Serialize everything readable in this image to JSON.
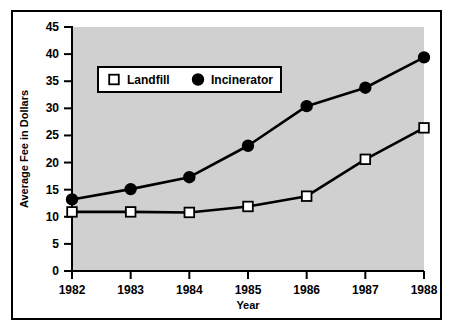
{
  "chart_data": {
    "type": "line",
    "title": "",
    "xlabel": "Year",
    "ylabel": "Average Fee in Dollars",
    "categories": [
      "1982",
      "1983",
      "1984",
      "1985",
      "1986",
      "1987",
      "1988"
    ],
    "x": [
      1982,
      1983,
      1984,
      1985,
      1986,
      1987,
      1988
    ],
    "series": [
      {
        "name": "Landfill",
        "marker": "open-square",
        "marker_fill": "#ffffff",
        "line_color": "#000000",
        "values": [
          10.9,
          10.9,
          10.8,
          11.9,
          13.8,
          20.6,
          26.4
        ]
      },
      {
        "name": "Incinerator",
        "marker": "filled-circle",
        "marker_fill": "#000000",
        "line_color": "#000000",
        "values": [
          13.2,
          15.1,
          17.3,
          23.1,
          30.4,
          33.8,
          39.4
        ]
      }
    ],
    "xlim": [
      1982,
      1988
    ],
    "ylim": [
      0,
      45
    ],
    "yticks": [
      0,
      5,
      10,
      15,
      20,
      25,
      30,
      35,
      40,
      45
    ],
    "ytick_labels": [
      "0",
      "5",
      "10",
      "15",
      "20",
      "25",
      "30",
      "35",
      "40",
      "45"
    ],
    "xticks": [
      1982,
      1983,
      1984,
      1985,
      1986,
      1987,
      1988
    ],
    "xtick_labels": [
      "1982",
      "1983",
      "1984",
      "1985",
      "1986",
      "1987",
      "1988"
    ],
    "grid": false,
    "legend_position": "upper-left-inside",
    "plot_background": "#d0d0d0",
    "figure_background": "#ffffff",
    "axis_color": "#000000",
    "border": true
  },
  "legend": {
    "entries": [
      {
        "label": "Landfill",
        "marker": "open-square"
      },
      {
        "label": "Incinerator",
        "marker": "filled-circle"
      }
    ]
  },
  "axes": {
    "y_axis_label": "Average Fee in Dollars",
    "x_axis_label": "Year"
  }
}
